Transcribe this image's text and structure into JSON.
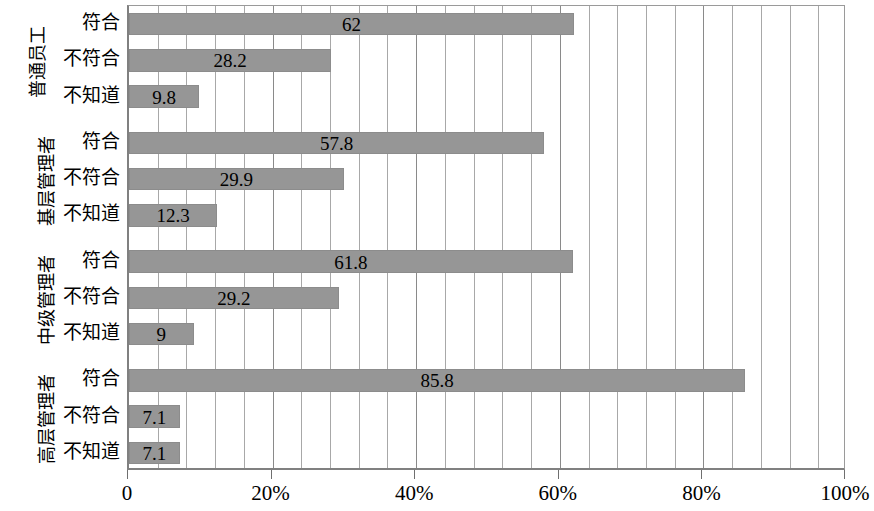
{
  "chart_data": {
    "type": "bar",
    "orientation": "horizontal",
    "title": "",
    "xlabel": "",
    "ylabel": "",
    "xlim": [
      0,
      100
    ],
    "grid": true,
    "grid_interval": 4,
    "legend": "none",
    "bar_color": "#969696",
    "axis_color": "#808080",
    "gridline_color": "#a8a8a8",
    "xticks": [
      0,
      20,
      40,
      60,
      80,
      100
    ],
    "xticklabels": [
      "0",
      "20%",
      "40%",
      "60%",
      "80%",
      "100%"
    ],
    "categories": [
      "符合",
      "不符合",
      "不知道"
    ],
    "groups": [
      {
        "label": "普通员工",
        "categories": [
          "符合",
          "不符合",
          "不知道"
        ],
        "values": [
          62,
          28.2,
          9.8
        ],
        "value_labels": [
          "62",
          "28.2",
          "9.8"
        ]
      },
      {
        "label": "基层管理者",
        "categories": [
          "符合",
          "不符合",
          "不知道"
        ],
        "values": [
          57.8,
          29.9,
          12.3
        ],
        "value_labels": [
          "57.8",
          "29.9",
          "12.3"
        ]
      },
      {
        "label": "中级管理者",
        "categories": [
          "符合",
          "不符合",
          "不知道"
        ],
        "values": [
          61.8,
          29.2,
          9
        ],
        "value_labels": [
          "61.8",
          "29.2",
          "9"
        ]
      },
      {
        "label": "高层管理者",
        "categories": [
          "符合",
          "不符合",
          "不知道"
        ],
        "values": [
          85.8,
          7.1,
          7.1
        ],
        "value_labels": [
          "85.8",
          "7.1",
          "7.1"
        ]
      }
    ]
  }
}
